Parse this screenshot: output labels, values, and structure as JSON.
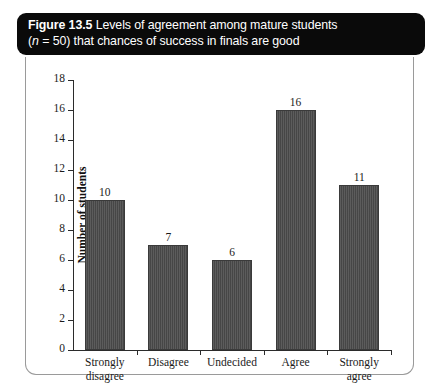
{
  "caption": {
    "figure_number": "Figure 13.5",
    "line1_rest": " Levels of agreement among mature students",
    "line2_prefix": "(",
    "line2_n": "n",
    "line2_rest": " = 50) that chances of success in finals are good"
  },
  "colors": {
    "banner_background": "#0a0a0a",
    "banner_text": "#ffffff",
    "bar_fill": "#4a4a4a",
    "axis": "#2b2b2b",
    "panel_border": "#9a9a9a",
    "panel_background": "#ffffff"
  },
  "chart_data": {
    "type": "bar",
    "title": "Figure 13.5 Levels of agreement among mature students (n = 50) that chances of success in finals are good",
    "categories": [
      "Strongly disagree",
      "Disagree",
      "Undecided",
      "Agree",
      "Strongly agree"
    ],
    "category_lines": [
      [
        "Strongly",
        "disagree"
      ],
      [
        "Disagree"
      ],
      [
        "Undecided"
      ],
      [
        "Agree"
      ],
      [
        "Strongly",
        "agree"
      ]
    ],
    "values": [
      10,
      7,
      6,
      16,
      11
    ],
    "value_labels": [
      "10",
      "7",
      "6",
      "16",
      "11"
    ],
    "xlabel": "",
    "ylabel": "Number of students",
    "ylim": [
      0,
      18
    ],
    "ytick_step": 2,
    "yticks": [
      0,
      2,
      4,
      6,
      8,
      10,
      12,
      14,
      16,
      18
    ],
    "ytick_labels": [
      "0",
      "2",
      "4",
      "6",
      "8",
      "10",
      "12",
      "14",
      "16",
      "18"
    ],
    "grid": false,
    "legend": false,
    "total": 50
  }
}
